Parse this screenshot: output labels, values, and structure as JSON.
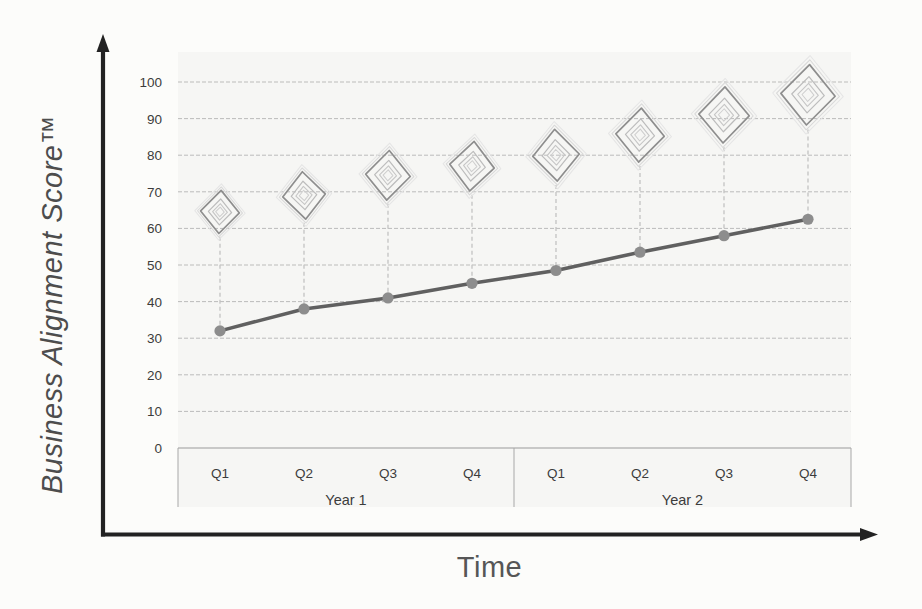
{
  "page": {
    "background": "#fcfcfa"
  },
  "chart_data": {
    "type": "line",
    "title": "",
    "xlabel": "Time",
    "ylabel": "Business Alignment Score™",
    "ylim": [
      0,
      100
    ],
    "yticks": [
      0,
      10,
      20,
      30,
      40,
      50,
      60,
      70,
      80,
      90,
      100
    ],
    "grid": true,
    "legend": "none",
    "categories": [
      "Q1",
      "Q2",
      "Q3",
      "Q4",
      "Q1",
      "Q2",
      "Q3",
      "Q4"
    ],
    "category_groups": [
      {
        "label": "Year 1",
        "span": 4
      },
      {
        "label": "Year 2",
        "span": 4
      }
    ],
    "series": [
      {
        "name": "Business Alignment Score",
        "type": "line",
        "marker": "circle",
        "values": [
          32,
          38,
          41,
          45,
          48.5,
          53.5,
          58,
          62.5
        ]
      },
      {
        "name": "Diamond milestone icons",
        "type": "scatter",
        "marker": "diamond-doodle",
        "values": [
          64.5,
          69,
          74.5,
          77,
          80,
          85.5,
          91,
          96.5
        ],
        "marker_sizes": [
          40,
          44,
          46,
          46,
          48,
          50,
          52,
          56
        ]
      }
    ]
  },
  "colors": {
    "axis": "#222222",
    "grid": "#aeaeae",
    "zero_line": "#9a9a9a",
    "strip_border": "#a8a8a8",
    "line": "#606060",
    "marker": "#8d8d8d",
    "diamond_main": "#8e8e8e",
    "diamond_inner": "#bcbcbc",
    "diamond_halo": "#d8d8d8",
    "diamond_halo_faint": "#e5e5e5",
    "connector": "#c3c3c3",
    "tick_text": "#3c3c3c",
    "title_text": "#4d4d4d"
  }
}
